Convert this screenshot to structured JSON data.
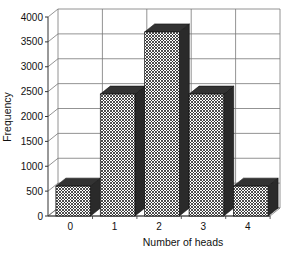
{
  "chart_data": {
    "type": "bar",
    "title": "",
    "xlabel": "Number of heads",
    "ylabel": "Frequency",
    "categories": [
      "0",
      "1",
      "2",
      "3",
      "4"
    ],
    "values": [
      600,
      2450,
      3700,
      2450,
      600
    ],
    "ylim": [
      0,
      4000
    ],
    "yticks": [
      0,
      500,
      1000,
      1500,
      2000,
      2500,
      3000,
      3500,
      4000
    ],
    "grid": true,
    "legend": null,
    "style": "3d-crosshatch"
  }
}
